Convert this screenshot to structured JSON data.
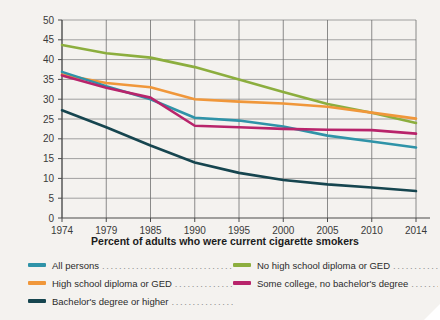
{
  "chart_data": {
    "type": "line",
    "title": "Percent of adults who were current cigarette smokers",
    "xlabel": "",
    "ylabel": "",
    "x": [
      1974,
      1979,
      1985,
      1990,
      1995,
      2000,
      2005,
      2010,
      2014
    ],
    "xtick_labels": [
      "1974",
      "1979",
      "1985",
      "1990",
      "1995",
      "2000",
      "2005",
      "2010",
      "2014"
    ],
    "ytick_labels": [
      "0",
      "5",
      "10",
      "15",
      "20",
      "25",
      "30",
      "35",
      "40",
      "45",
      "50"
    ],
    "ylim": [
      0,
      50
    ],
    "ystep": 5,
    "grid": true,
    "legend_position": "below",
    "series": [
      {
        "name": "All persons",
        "color": "#2f93a8",
        "values": [
          36.9,
          33.3,
          30.0,
          25.3,
          24.6,
          23.1,
          20.8,
          19.3,
          17.8
        ]
      },
      {
        "name": "High school diploma or GED",
        "color": "#f0973a",
        "values": [
          36.2,
          34.1,
          33.0,
          30.0,
          29.4,
          28.9,
          28.1,
          26.6,
          25.1
        ]
      },
      {
        "name": "Bachelor's degree or higher",
        "color": "#16454f",
        "values": [
          27.2,
          22.9,
          18.3,
          14.0,
          11.4,
          9.6,
          8.5,
          7.7,
          6.8
        ]
      },
      {
        "name": "No high school diploma or GED",
        "color": "#8cae3e",
        "values": [
          43.7,
          41.6,
          40.5,
          38.1,
          35.0,
          31.8,
          28.8,
          26.6,
          24.0
        ]
      },
      {
        "name": "Some college, no bachelor's degree",
        "color": "#b8246b",
        "values": [
          36.0,
          32.9,
          30.4,
          23.3,
          22.9,
          22.5,
          22.3,
          22.2,
          21.3
        ]
      }
    ]
  },
  "legend": {
    "left_items": [
      {
        "label": "All persons",
        "color": "#2f93a8",
        "leader": "................................"
      },
      {
        "label": "High school diploma or GED",
        "color": "#f0973a",
        "leader": "................."
      },
      {
        "label": "Bachelor's degree or higher",
        "color": "#16454f",
        "leader": "................"
      }
    ],
    "right_items": [
      {
        "label": "No high school diploma or GED",
        "color": "#8cae3e",
        "leader": "............."
      },
      {
        "label": "Some college, no bachelor's degree",
        "color": "#b8246b",
        "leader": "........"
      }
    ]
  },
  "colors": {
    "background": "#f4f2ef",
    "grid": "#8a8a8a",
    "axis": "#4a4a4a",
    "text": "#2b2b2b"
  }
}
